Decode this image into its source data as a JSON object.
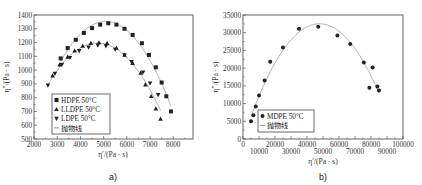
{
  "chart_data": [
    {
      "type": "scatter",
      "panel_label": "a)",
      "title": "",
      "xlabel": "η′/(Pa · s)",
      "ylabel": "η″/(Pa · s)",
      "xlim": [
        2000,
        8800
      ],
      "ylim": [
        500,
        1400
      ],
      "xticks": [
        "2000",
        "3000",
        "4000",
        "5000",
        "6000",
        "7000",
        "8000"
      ],
      "yticks": [
        "500",
        "600",
        "700",
        "800",
        "900",
        "1000",
        "1100",
        "1200",
        "1300",
        "1400"
      ],
      "grid": false,
      "legend_position": "lower-left inside",
      "legend": [
        "HDPE 50°C",
        "LLDPE 50°C",
        "LDPE 50°C",
        "抛物线"
      ],
      "series": [
        {
          "name": "HDPE 50°C",
          "marker": "square",
          "x": [
            3150,
            3450,
            3800,
            4150,
            4500,
            4850,
            5200,
            5550,
            5900,
            6250,
            6650,
            6950,
            7250,
            7500,
            7700,
            7900
          ],
          "y": [
            1085,
            1160,
            1220,
            1270,
            1305,
            1330,
            1340,
            1330,
            1300,
            1255,
            1195,
            1110,
            1020,
            910,
            810,
            700
          ]
        },
        {
          "name": "LLDPE 50°C",
          "marker": "triangle-up",
          "x": [
            2800,
            3100,
            3450,
            3750,
            4100,
            4450,
            4800,
            5150,
            5550,
            5900,
            6250,
            6600,
            6800,
            7050,
            7250,
            7450
          ],
          "y": [
            960,
            1040,
            1095,
            1140,
            1175,
            1195,
            1200,
            1195,
            1160,
            1110,
            1050,
            980,
            895,
            810,
            720,
            645
          ]
        },
        {
          "name": "LDPE 50°C",
          "marker": "triangle-down",
          "x": [
            2600,
            2900,
            3200,
            3550,
            3950,
            4350,
            4750,
            5100,
            5500,
            5900,
            6200,
            6700,
            7000,
            7350
          ],
          "y": [
            890,
            975,
            1040,
            1090,
            1140,
            1165,
            1180,
            1175,
            1150,
            1110,
            1060,
            985,
            905,
            820
          ]
        },
        {
          "name": "抛物线",
          "marker": "line",
          "fits": [
            "HDPE",
            "LLDPE/LDPE"
          ]
        }
      ]
    },
    {
      "type": "scatter",
      "panel_label": "b)",
      "title": "",
      "xlabel": "η′/(Pa · s)",
      "ylabel": "η″/(Pa · s)",
      "xlim": [
        0,
        100000
      ],
      "ylim": [
        0,
        35000
      ],
      "xticks": [
        "0",
        "10000",
        "20000",
        "30000",
        "40000",
        "50000",
        "60000",
        "70000",
        "80000",
        "90000",
        "100000"
      ],
      "yticks": [
        "0",
        "5000",
        "10000",
        "15000",
        "20000",
        "25000",
        "30000",
        "35000"
      ],
      "grid": false,
      "legend_position": "lower-left inside",
      "legend": [
        "MDPE 50°C",
        "抛物线"
      ],
      "series": [
        {
          "name": "MDPE 50°C",
          "marker": "circle",
          "x": [
            5000,
            6500,
            8000,
            10000,
            13500,
            17000,
            25000,
            35000,
            47000,
            59000,
            67000,
            75500,
            79000,
            81000,
            84000,
            85000
          ],
          "y": [
            5000,
            6700,
            9200,
            12300,
            16500,
            21800,
            25800,
            31100,
            31700,
            29200,
            26800,
            21600,
            14500,
            20200,
            14800,
            13700
          ]
        },
        {
          "name": "抛物线",
          "marker": "line"
        }
      ]
    }
  ]
}
